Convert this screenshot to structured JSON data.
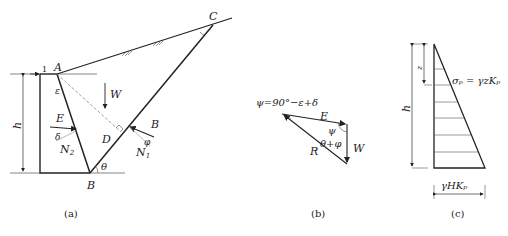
{
  "figure_a": {
    "caption": "(a)",
    "points": {
      "A": "A",
      "B": "B",
      "C": "C",
      "D": "D"
    },
    "labels": {
      "h": "h",
      "epsilon": "ε",
      "W": "W",
      "E": "E",
      "delta": "δ",
      "N2": "N",
      "N2_sub": "2",
      "B_force": "B",
      "phi": "φ",
      "N1": "N",
      "N1_sub": "1",
      "theta": "θ",
      "one": "1"
    }
  },
  "figure_b": {
    "caption": "(b)",
    "equation": "ψ=90°−ε+δ",
    "labels": {
      "E": "E",
      "psi": "ψ",
      "theta_phi": "θ+φ",
      "R": "R",
      "W": "W"
    }
  },
  "figure_c": {
    "caption": "(c)",
    "labels": {
      "z": "z",
      "h": "h",
      "sigma_eq": "σₚ = γzKₚ",
      "base": "γHKₚ"
    }
  },
  "colors": {
    "line": "#222222",
    "dashed": "#888888",
    "background": "#ffffff"
  }
}
